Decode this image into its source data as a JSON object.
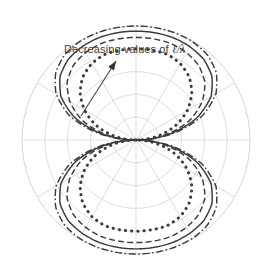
{
  "figure": {
    "name": "polar-radiation-pattern",
    "background_color": "#ffffff"
  },
  "annotation": {
    "prefix_label": "Decreasing values of ",
    "symbol_label": "ℓ/λ",
    "full_label": "Decreasing values of ℓ/λ",
    "arrow_name": "decreasing-values-arrow"
  },
  "colors": {
    "grid": "#cfcfcf",
    "axis": "#d4d4d4",
    "curve": "#3a3a3a",
    "curve_light": "#4d4d4d",
    "text": "#404040"
  },
  "chart_data": {
    "type": "line",
    "projection": "polar",
    "title": "",
    "subtitle": "",
    "xlabel": "",
    "ylabel": "",
    "grid": true,
    "legend_position": "none",
    "annotations": [
      {
        "text": "Decreasing values of ℓ/λ",
        "x_px": 64,
        "y_px": 43,
        "arrow_from_px": [
          81,
          116
        ],
        "arrow_to_px": [
          116,
          61
        ]
      }
    ],
    "polar_grid": {
      "center_px": [
        136,
        140
      ],
      "outer_radius_px": 114,
      "radial_circles_normalized": [
        0.2,
        0.4,
        0.6,
        0.8,
        1.0
      ],
      "spoke_angles_deg": [
        0,
        30,
        60,
        90,
        120,
        150,
        180,
        210,
        240,
        270,
        300,
        330
      ],
      "rlim": [
        0,
        1
      ],
      "theta_tick_labels": []
    },
    "series": [
      {
        "name": "largest l/lambda",
        "style": "dashdot",
        "max_normalized_radius": 1.0,
        "values_by_theta_deg": {
          "0": 0.0,
          "10": 0.33,
          "20": 0.62,
          "30": 0.81,
          "40": 0.92,
          "50": 0.975,
          "60": 0.995,
          "70": 1.0,
          "80": 1.0,
          "90": 1.0,
          "100": 1.0,
          "110": 1.0,
          "120": 0.995,
          "130": 0.975,
          "140": 0.92,
          "150": 0.81,
          "160": 0.62,
          "170": 0.33,
          "180": 0.0
        }
      },
      {
        "name": "second l/lambda",
        "style": "solid",
        "max_normalized_radius": 0.955,
        "values_by_theta_deg": {
          "0": 0.0,
          "10": 0.3,
          "20": 0.57,
          "30": 0.76,
          "40": 0.87,
          "50": 0.925,
          "60": 0.945,
          "70": 0.955,
          "80": 0.955,
          "90": 0.955,
          "100": 0.955,
          "110": 0.955,
          "120": 0.945,
          "130": 0.925,
          "140": 0.87,
          "150": 0.76,
          "160": 0.57,
          "170": 0.3,
          "180": 0.0
        }
      },
      {
        "name": "third l/lambda",
        "style": "dashed",
        "max_normalized_radius": 0.9,
        "values_by_theta_deg": {
          "0": 0.0,
          "10": 0.26,
          "20": 0.5,
          "30": 0.67,
          "40": 0.79,
          "50": 0.855,
          "60": 0.885,
          "70": 0.9,
          "80": 0.9,
          "90": 0.9,
          "100": 0.9,
          "110": 0.9,
          "120": 0.885,
          "130": 0.855,
          "140": 0.79,
          "150": 0.67,
          "160": 0.5,
          "170": 0.26,
          "180": 0.0
        }
      },
      {
        "name": "smallest l/lambda",
        "style": "dotted",
        "max_normalized_radius": 0.8,
        "values_by_theta_deg": {
          "0": 0.0,
          "10": 0.19,
          "20": 0.37,
          "30": 0.52,
          "40": 0.64,
          "50": 0.725,
          "60": 0.775,
          "70": 0.8,
          "80": 0.8,
          "90": 0.8,
          "100": 0.8,
          "110": 0.8,
          "120": 0.775,
          "130": 0.725,
          "140": 0.64,
          "150": 0.52,
          "160": 0.37,
          "170": 0.19,
          "180": 0.0
        }
      }
    ]
  }
}
